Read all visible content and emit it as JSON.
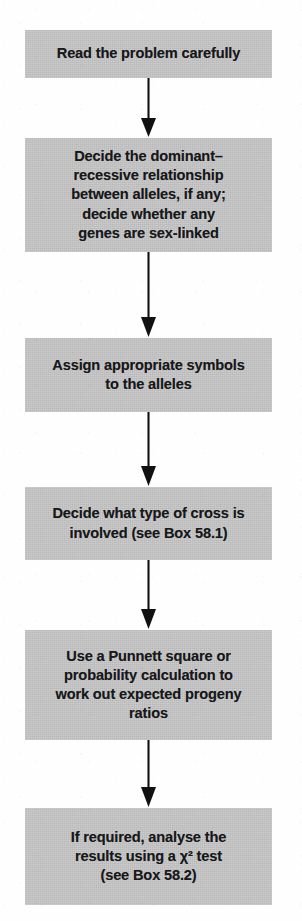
{
  "diagram": {
    "type": "flowchart",
    "orientation": "vertical",
    "node_fill_color": "#c6c6c6",
    "text_color": "#17181a",
    "background_color": "#fefefe",
    "arrow_color": "#111111",
    "nodes": [
      {
        "id": "step-1",
        "label": "Read the problem carefully",
        "top": 30,
        "height": 48
      },
      {
        "id": "step-2",
        "label": "Decide the dominant–\nrecessive relationship\nbetween alleles, if any;\ndecide whether any\ngenes are sex-linked",
        "top": 138,
        "height": 114
      },
      {
        "id": "step-3",
        "label": "Assign appropriate symbols\nto the alleles",
        "top": 338,
        "height": 74
      },
      {
        "id": "step-4",
        "label": "Decide what type of cross is\ninvolved (see Box 58.1)",
        "top": 487,
        "height": 73
      },
      {
        "id": "step-5",
        "label": "Use a Punnett square or\nprobability calculation to\nwork out expected progeny\nratios",
        "top": 630,
        "height": 110
      },
      {
        "id": "step-6",
        "label": "If required, analyse the\nresults using a χ² test\n(see Box 58.2)",
        "top": 808,
        "height": 97
      }
    ],
    "connectors": [
      {
        "id": "arrow-1-2",
        "from": "step-1",
        "to": "step-2",
        "top": 78,
        "height": 60
      },
      {
        "id": "arrow-2-3",
        "from": "step-2",
        "to": "step-3",
        "top": 252,
        "height": 86
      },
      {
        "id": "arrow-3-4",
        "from": "step-3",
        "to": "step-4",
        "top": 412,
        "height": 75
      },
      {
        "id": "arrow-4-5",
        "from": "step-4",
        "to": "step-5",
        "top": 560,
        "height": 70
      },
      {
        "id": "arrow-5-6",
        "from": "step-5",
        "to": "step-6",
        "top": 740,
        "height": 68
      }
    ]
  }
}
